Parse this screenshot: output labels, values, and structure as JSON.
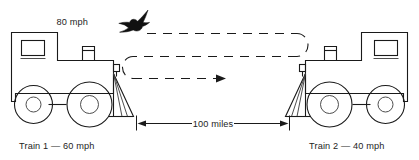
{
  "diagram": {
    "background_color": "#ffffff",
    "ink_color": "#1a1a1a",
    "labels": {
      "bird_speed": "80 mph",
      "distance": "100 miles",
      "train_left": "Train 1 — 60 mph",
      "train_right": "Train 2 — 40 mph"
    },
    "elements": {
      "bird_icon_name": "bird-silhouette-icon",
      "train_left_icon_name": "locomotive-facing-right-icon",
      "train_right_icon_name": "locomotive-facing-left-icon",
      "flight_path_name": "bird-flight-path-dashed",
      "distance_measure_name": "distance-dimension-arrow"
    },
    "values": {
      "bird_speed_mph": 80,
      "train_1_speed_mph": 60,
      "train_2_speed_mph": 40,
      "separation_miles": 100
    }
  }
}
